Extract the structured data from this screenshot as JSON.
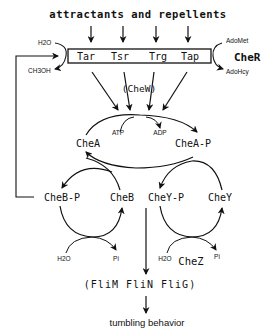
{
  "diagram": {
    "title": "attractants and repellents",
    "receptors": [
      "Tar",
      "Tsr",
      "Trg",
      "Tap"
    ],
    "methylation": {
      "left_in": "H2O",
      "left_out": "CH3OH",
      "right_in": "AdoMet",
      "right_out": "AdoHcy",
      "enzyme": "CheR"
    },
    "coupling": "(CheW)",
    "kinase": {
      "from": "CheA",
      "to": "CheA-P",
      "cofactor_in": "ATP",
      "cofactor_out": "ADP"
    },
    "cheB_cycle": {
      "phospho": "CheB-P",
      "free": "CheB",
      "water": "H2O",
      "phosphate": "Pi"
    },
    "cheY_cycle": {
      "phospho": "CheY-P",
      "free": "CheY",
      "water": "H2O",
      "phosphate": "Pi",
      "phosphatase": "CheZ"
    },
    "motor": "(FliM FliN FliG)",
    "output": "tumbling behavior"
  },
  "colors": {
    "ink": "#111111",
    "background": "#ffffff"
  }
}
